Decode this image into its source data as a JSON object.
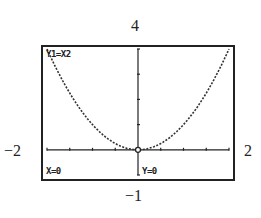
{
  "chart_data": {
    "type": "line",
    "function": "y = x^2",
    "xlabel": "",
    "ylabel": "",
    "xlim": [
      -2,
      2
    ],
    "ylim": [
      -1,
      4
    ],
    "x": [
      -2,
      -1.5,
      -1,
      -0.5,
      0,
      0.5,
      1,
      1.5,
      2
    ],
    "series": [
      {
        "name": "Y1",
        "values": [
          4,
          2.25,
          1,
          0.25,
          0,
          0.25,
          1,
          2.25,
          4
        ]
      }
    ],
    "grid": false,
    "trace_point": {
      "x": 0,
      "y": 0
    }
  },
  "window": {
    "xmin": "−2",
    "xmax": "2",
    "ymin": "−1",
    "ymax": "4"
  },
  "screen": {
    "function_label": "Y1=X2",
    "x_readout": "X=0",
    "y_readout": "Y=0"
  }
}
